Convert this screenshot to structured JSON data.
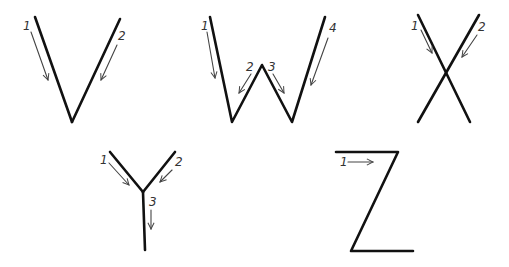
{
  "colors": {
    "stroke": "#111111",
    "arrow": "#444444",
    "label": "#333333",
    "background": "#ffffff"
  },
  "letters": [
    {
      "letter": "V",
      "strokes": [
        "35,17 72,122",
        "120,19 72,122"
      ],
      "arrows": [
        {
          "label": "1",
          "from": [
            31,
            32
          ],
          "to": [
            48,
            80
          ],
          "label_pos": [
            23,
            30
          ]
        },
        {
          "label": "2",
          "from": [
            117,
            45
          ],
          "to": [
            101,
            80
          ],
          "label_pos": [
            118,
            40
          ]
        }
      ]
    },
    {
      "letter": "W",
      "strokes": [
        "210,17 232,122 262,65 292,122 325,17"
      ],
      "arrows": [
        {
          "label": "1",
          "from": [
            207,
            32
          ],
          "to": [
            215,
            78
          ],
          "label_pos": [
            201,
            30
          ]
        },
        {
          "label": "2",
          "from": [
            251,
            74
          ],
          "to": [
            239,
            93
          ],
          "label_pos": [
            246,
            71
          ]
        },
        {
          "label": "3",
          "from": [
            273,
            74
          ],
          "to": [
            284,
            93
          ],
          "label_pos": [
            268,
            71
          ]
        },
        {
          "label": "4",
          "from": [
            328,
            38
          ],
          "to": [
            311,
            85
          ],
          "label_pos": [
            329,
            32
          ]
        }
      ]
    },
    {
      "letter": "X",
      "strokes": [
        "418,15 470,122",
        "479,15 418,122"
      ],
      "arrows": [
        {
          "label": "1",
          "from": [
            421,
            30
          ],
          "to": [
            432,
            53
          ],
          "label_pos": [
            411,
            30
          ]
        },
        {
          "label": "2",
          "from": [
            477,
            35
          ],
          "to": [
            462,
            57
          ],
          "label_pos": [
            478,
            31
          ]
        }
      ]
    },
    {
      "letter": "Y",
      "strokes": [
        "110,152 143,192",
        "175,152 143,192",
        "143,192 145,250"
      ],
      "arrows": [
        {
          "label": "1",
          "from": [
            109,
            163
          ],
          "to": [
            129,
            185
          ],
          "label_pos": [
            100,
            164
          ]
        },
        {
          "label": "2",
          "from": [
            172,
            170
          ],
          "to": [
            160,
            182
          ],
          "label_pos": [
            175,
            166
          ]
        },
        {
          "label": "3",
          "from": [
            151,
            210
          ],
          "to": [
            151,
            229
          ],
          "label_pos": [
            149,
            206
          ]
        }
      ]
    },
    {
      "letter": "Z",
      "strokes": [
        "336,152 398,152 351,251 413,251"
      ],
      "arrows": [
        {
          "label": "1",
          "from": [
            348,
            162
          ],
          "to": [
            373,
            162
          ],
          "label_pos": [
            340,
            166
          ]
        }
      ]
    }
  ]
}
